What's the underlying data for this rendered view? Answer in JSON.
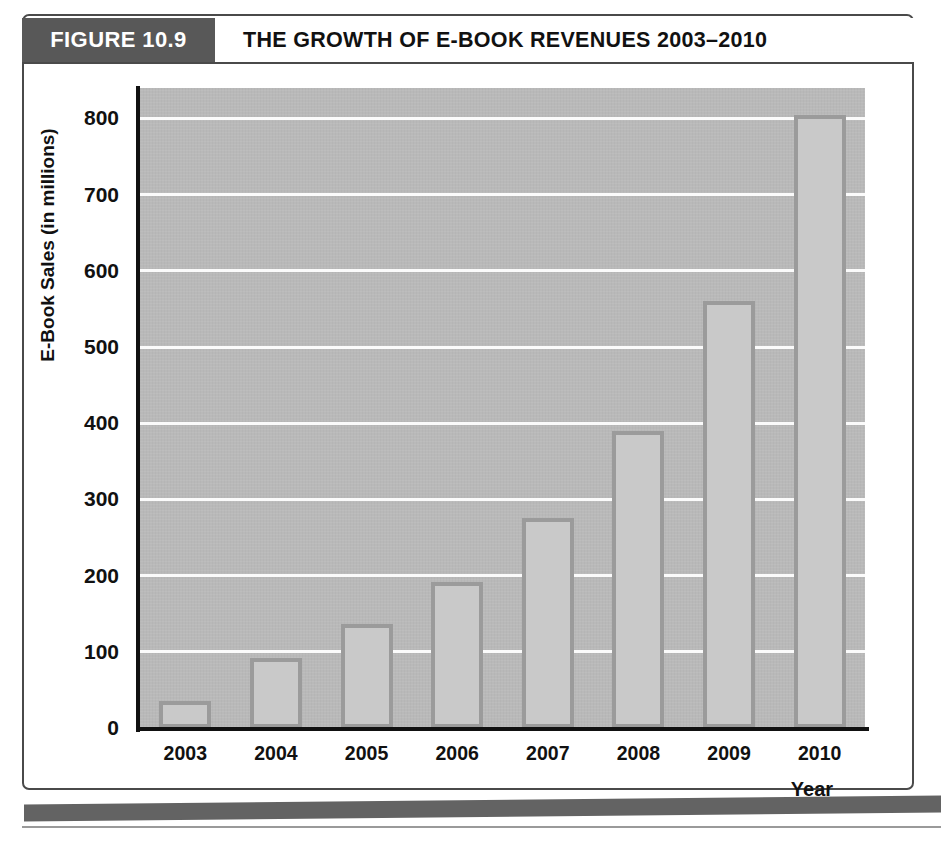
{
  "figure": {
    "tab_label": "FIGURE 10.9",
    "title": "THE GROWTH OF E-BOOK REVENUES 2003–2010"
  },
  "colors": {
    "tab_background": "#585858",
    "plot_background": "#b9b9b9",
    "bar_fill": "#c9c9c9",
    "bar_border": "#9b9b9b",
    "gridline": "#fbfbfb",
    "axis": "#111111",
    "footer_rule": "#636363"
  },
  "chart_data": {
    "type": "bar",
    "title": "THE GROWTH OF E-BOOK REVENUES 2003–2010",
    "xlabel": "Year",
    "ylabel": "E-Book Sales (in millions)",
    "categories": [
      "2003",
      "2004",
      "2005",
      "2006",
      "2007",
      "2008",
      "2009",
      "2010"
    ],
    "values": [
      35,
      92,
      137,
      191,
      275,
      390,
      560,
      805
    ],
    "ylim": [
      0,
      840
    ],
    "yticks": [
      0,
      100,
      200,
      300,
      400,
      500,
      600,
      700,
      800
    ],
    "ytick_labels": [
      "0",
      "100",
      "200",
      "300",
      "400",
      "500",
      "600",
      "700",
      "800"
    ],
    "grid": true,
    "legend": null
  }
}
